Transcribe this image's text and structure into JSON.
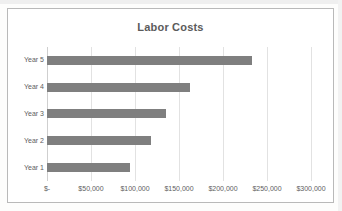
{
  "chart_data": {
    "type": "bar",
    "orientation": "horizontal",
    "title": "Labor Costs",
    "categories": [
      "Year 1",
      "Year 2",
      "Year 3",
      "Year 4",
      "Year 5"
    ],
    "values": [
      94000,
      118000,
      135000,
      162000,
      233000
    ],
    "category_order_top_to_bottom": [
      "Year 5",
      "Year 4",
      "Year 3",
      "Year 2",
      "Year 1"
    ],
    "xlabel": "",
    "ylabel": "",
    "xlim": [
      0,
      300000
    ],
    "xticks": [
      0,
      50000,
      100000,
      150000,
      200000,
      250000,
      300000
    ],
    "xtick_labels": [
      "$-",
      "$50,000",
      "$100,000",
      "$150,000",
      "$200,000",
      "$250,000",
      "$300,000"
    ],
    "grid": "vertical",
    "legend": null,
    "series": [
      {
        "name": "Labor Costs",
        "color": "#7f7f7f",
        "points": [
          {
            "category": "Year 5",
            "value": 233000
          },
          {
            "category": "Year 4",
            "value": 162000
          },
          {
            "category": "Year 3",
            "value": 135000
          },
          {
            "category": "Year 2",
            "value": 118000
          },
          {
            "category": "Year 1",
            "value": 94000
          }
        ]
      }
    ]
  },
  "colors": {
    "bar": "#7f7f7f",
    "gridline": "#e2e2e2",
    "axis": "#cfcfcf",
    "frame_border": "#b9b9b9",
    "title_text": "#5b5b5b",
    "tick_text": "#5e5e5e",
    "plot_background": "#ffffff"
  }
}
